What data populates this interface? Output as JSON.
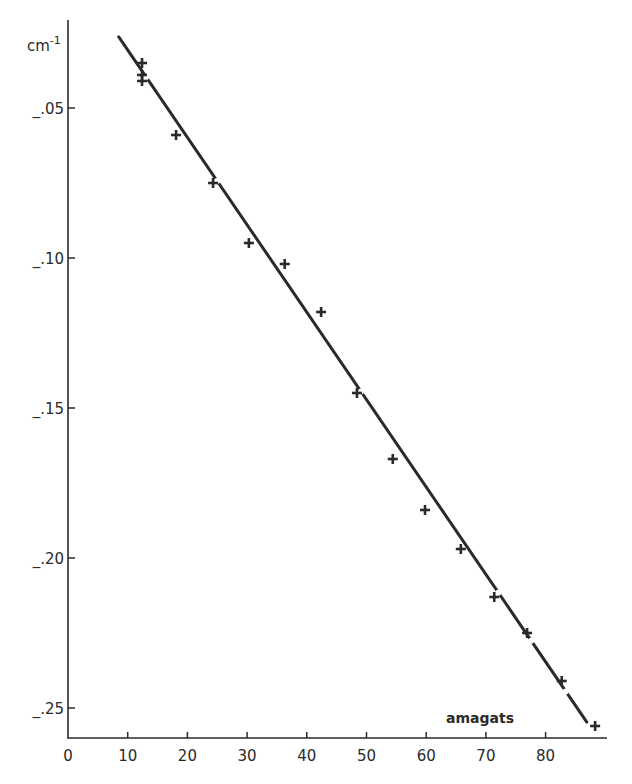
{
  "chart_data": {
    "type": "scatter",
    "title": "",
    "xlabel": "amagats",
    "ylabel": "cm-1",
    "ylabel_display": {
      "base": "cm",
      "sup": "-1"
    },
    "xlim": [
      0,
      90
    ],
    "ylim": [
      -0.26,
      -0.02
    ],
    "grid": false,
    "legend": null,
    "x_ticks": [
      0,
      10,
      20,
      30,
      40,
      50,
      60,
      70,
      80
    ],
    "x_tick_labels": [
      "0",
      "10",
      "20",
      "30",
      "40",
      "50",
      "60",
      "70",
      "80"
    ],
    "y_ticks": [
      -0.05,
      -0.1,
      -0.15,
      -0.2,
      -0.25
    ],
    "y_tick_labels": [
      "_.05",
      "_.10",
      "_.15",
      "_.20",
      "_.25"
    ],
    "series": [
      {
        "name": "measured",
        "marker": "plus",
        "points": [
          {
            "x": 12.4,
            "y": -0.035
          },
          {
            "x": 12.4,
            "y": -0.039
          },
          {
            "x": 12.4,
            "y": -0.041
          },
          {
            "x": 18.1,
            "y": -0.059
          },
          {
            "x": 24.3,
            "y": -0.075
          },
          {
            "x": 30.3,
            "y": -0.095
          },
          {
            "x": 36.3,
            "y": -0.102
          },
          {
            "x": 42.4,
            "y": -0.118
          },
          {
            "x": 48.4,
            "y": -0.145
          },
          {
            "x": 54.4,
            "y": -0.167
          },
          {
            "x": 59.8,
            "y": -0.184
          },
          {
            "x": 65.8,
            "y": -0.197
          },
          {
            "x": 71.4,
            "y": -0.213
          },
          {
            "x": 76.9,
            "y": -0.225
          },
          {
            "x": 82.7,
            "y": -0.241
          },
          {
            "x": 88.3,
            "y": -0.256
          }
        ]
      },
      {
        "name": "linear fit",
        "type": "line",
        "points": [
          {
            "x": 8.5,
            "y": -0.0263
          },
          {
            "x": 86.9,
            "y": -0.2547
          }
        ],
        "gaps_at_x": [
          12.4,
          24.3,
          48.4,
          71.4,
          76.9,
          82.7
        ]
      }
    ]
  },
  "colors": {
    "ink": "#2a2a2a",
    "background": "#ffffff"
  }
}
